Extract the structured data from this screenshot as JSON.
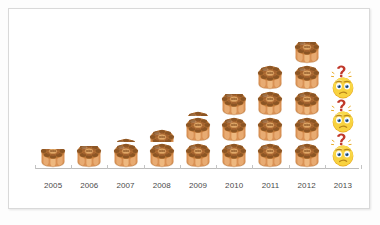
{
  "chart_data": {
    "type": "bar",
    "title": "",
    "subtitle": "",
    "xlabel": "",
    "ylabel": "",
    "categories": [
      "2005",
      "2006",
      "2007",
      "2008",
      "2009",
      "2010",
      "2011",
      "2012",
      "2013"
    ],
    "values": [
      0.7,
      0.8,
      1.2,
      1.6,
      2.2,
      2.8,
      4,
      5,
      null
    ],
    "unit_symbol": "mooncake-pastry-icon",
    "unknown_symbol": "confused-face-question-icon",
    "unknown_symbol_count": 3,
    "unknown_categories": [
      "2013"
    ],
    "grid": false,
    "legend": "none",
    "ylim": [
      0,
      5.5
    ],
    "series": [
      {
        "name": "pastries",
        "values": [
          0.7,
          0.8,
          1.2,
          1.6,
          2.2,
          2.8,
          4,
          5,
          null
        ]
      }
    ],
    "colors": {
      "icon_light": "#e2a062",
      "icon_mid": "#c9813f",
      "icon_dark": "#8a5424",
      "emoji_face": "#f9d949",
      "emoji_shade": "#e8a81f",
      "emoji_question": "#c0392b",
      "axis": "#bdbdbd",
      "label_text": "#4a4a4a",
      "card_border": "#d9d9d9",
      "background": "#ffffff"
    }
  },
  "axis": {
    "tick_labels": [
      "2005",
      "2006",
      "2007",
      "2008",
      "2009",
      "2010",
      "2011",
      "2012",
      "2013"
    ]
  },
  "columns": [
    {
      "label": "2005",
      "full_units": 0,
      "partial": "p70",
      "emoji_count": 0
    },
    {
      "label": "2006",
      "full_units": 0,
      "partial": "p80",
      "emoji_count": 0
    },
    {
      "label": "2007",
      "full_units": 1,
      "partial": "p20",
      "emoji_count": 0
    },
    {
      "label": "2008",
      "full_units": 1,
      "partial": "p60",
      "emoji_count": 0
    },
    {
      "label": "2009",
      "full_units": 2,
      "partial": "p25",
      "emoji_count": 0
    },
    {
      "label": "2010",
      "full_units": 2,
      "partial": "p80",
      "emoji_count": 0
    },
    {
      "label": "2011",
      "full_units": 4,
      "partial": "",
      "emoji_count": 0
    },
    {
      "label": "2012",
      "full_units": 4,
      "partial": "p80",
      "emoji_count": 0
    },
    {
      "label": "2013",
      "full_units": 0,
      "partial": "",
      "emoji_count": 3
    }
  ]
}
